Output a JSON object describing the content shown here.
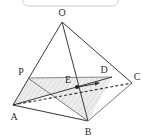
{
  "figure": {
    "kind": "geometry-diagram",
    "title_bar": {
      "present": true,
      "shape": "rounded-rectangle-outline",
      "fill": "#ffffff",
      "stroke": "#cfcfcf",
      "text": ""
    },
    "background_color": "#ffffff",
    "stroke_color": "#3a3a3a",
    "shade_fill": "#ebebeb",
    "hatch_color": "#bdbdbd",
    "dash_color": "#2e2e2e",
    "arrow_color": "#2e2e2e",
    "label_color": "#2b2b2b",
    "vertices": [
      {
        "id": "O",
        "label": "O",
        "x": 62,
        "y": 22,
        "label_x": 62,
        "label_y": 13
      },
      {
        "id": "P",
        "label": "P",
        "x": 28,
        "y": 78,
        "label_x": 21,
        "label_y": 72
      },
      {
        "id": "A",
        "label": "A",
        "x": 13,
        "y": 105,
        "label_x": 14,
        "label_y": 117
      },
      {
        "id": "B",
        "label": "B",
        "x": 88,
        "y": 121,
        "label_x": 88,
        "label_y": 132
      },
      {
        "id": "C",
        "label": "C",
        "x": 132,
        "y": 83,
        "label_x": 137,
        "label_y": 77
      },
      {
        "id": "D",
        "label": "D",
        "x": 112,
        "y": 77,
        "label_x": 104,
        "label_y": 70
      },
      {
        "id": "E",
        "label": "E",
        "x": 77,
        "y": 87,
        "label_x": 68,
        "label_y": 80
      }
    ],
    "edges": [
      {
        "name": "O-A",
        "from": "O",
        "to": "A",
        "style": "solid"
      },
      {
        "name": "O-B",
        "from": "O",
        "to": "B",
        "style": "solid"
      },
      {
        "name": "O-C",
        "from": "O",
        "to": "C",
        "style": "solid"
      },
      {
        "name": "A-B",
        "from": "A",
        "to": "B",
        "style": "solid"
      },
      {
        "name": "B-C",
        "from": "B",
        "to": "C",
        "style": "solid"
      },
      {
        "name": "A-C",
        "from": "A",
        "to": "C",
        "style": "dashed"
      },
      {
        "name": "P-D",
        "from": "P",
        "to": "D",
        "style": "solid"
      },
      {
        "name": "P-B",
        "from": "P",
        "to": "B",
        "style": "solid"
      },
      {
        "name": "A-D",
        "from": "A",
        "to": "D",
        "style": "solid"
      }
    ],
    "shaded_regions": [
      {
        "name": "section-plane-PDB",
        "points": "28,78 112,77 88,121",
        "hatched": true
      },
      {
        "name": "section-plane-APD",
        "points": "13,105 28,78 112,77",
        "hatched": true
      }
    ],
    "marked_point": {
      "id": "E",
      "x": 77,
      "y": 87,
      "radius": 2
    },
    "arrow": {
      "name": "direction-arrow-E-to-D",
      "x1": 78,
      "y1": 87,
      "x2": 101,
      "y2": 83
    }
  }
}
